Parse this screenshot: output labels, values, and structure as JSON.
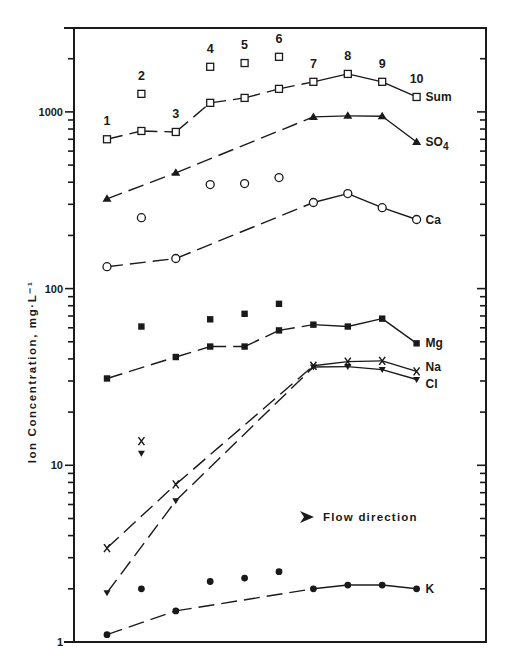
{
  "chart_data": {
    "type": "line",
    "title": "",
    "xlabel": "",
    "ylabel": "Ion Concentration, mg·L⁻¹",
    "yscale": "log",
    "ylim": [
      1,
      3000
    ],
    "y_ticks": [
      1,
      10,
      100,
      1000
    ],
    "y_tick_labels": [
      "1",
      "10",
      "100",
      "1000"
    ],
    "grid": false,
    "legend_position": "inline-right",
    "x": [
      1,
      2,
      3,
      4,
      5,
      6,
      7,
      8,
      9,
      10
    ],
    "station_labels": [
      "1",
      "2",
      "3",
      "4",
      "5",
      "6",
      "7",
      "8",
      "9",
      "10"
    ],
    "annotation": {
      "text": "Flow direction",
      "icon": "arrow-right-icon"
    },
    "series": [
      {
        "name": "Sum",
        "marker": "open-square",
        "line": {
          "stations": [
            1,
            2,
            3,
            4,
            5,
            6,
            7,
            8,
            9,
            10
          ],
          "values": [
            700,
            780,
            770,
            1125,
            1200,
            1350,
            1480,
            1640,
            1480,
            1215
          ]
        },
        "isolated": {
          "stations": [
            2,
            4,
            5,
            6
          ],
          "values": [
            1265,
            1800,
            1890,
            2050
          ]
        }
      },
      {
        "name": "SO4",
        "marker": "filled-triangle",
        "line": {
          "stations": [
            1,
            3,
            7,
            8,
            9,
            10
          ],
          "values": [
            322,
            452,
            937,
            950,
            945,
            676
          ]
        },
        "isolated": {
          "stations": [],
          "values": []
        }
      },
      {
        "name": "Ca",
        "marker": "open-circle",
        "line": {
          "stations": [
            1,
            3,
            7,
            8,
            9,
            10
          ],
          "values": [
            133,
            148,
            307,
            345,
            287,
            246
          ]
        },
        "isolated": {
          "stations": [
            2,
            4,
            5,
            6
          ],
          "values": [
            252,
            388,
            393,
            425
          ]
        }
      },
      {
        "name": "Mg",
        "marker": "filled-square",
        "line": {
          "stations": [
            1,
            3,
            4,
            5,
            6,
            7,
            8,
            9,
            10
          ],
          "values": [
            31,
            41,
            47,
            47,
            58,
            62.5,
            61,
            67.6,
            49
          ]
        },
        "isolated": {
          "stations": [
            2,
            4,
            5,
            6
          ],
          "values": [
            61,
            67,
            72,
            82
          ]
        }
      },
      {
        "name": "Na",
        "marker": "x",
        "line": {
          "stations": [
            1,
            3,
            7,
            8,
            9,
            10
          ],
          "values": [
            3.4,
            7.8,
            36.6,
            38.6,
            39,
            34
          ]
        },
        "isolated": {
          "stations": [
            2
          ],
          "values": [
            13.7
          ]
        }
      },
      {
        "name": "Cl",
        "marker": "filled-down-triangle",
        "line": {
          "stations": [
            1,
            3,
            7,
            8,
            9,
            10
          ],
          "values": [
            1.9,
            6.3,
            36,
            36.2,
            34.8,
            30.6
          ]
        },
        "isolated": {
          "stations": [
            2
          ],
          "values": [
            11.7
          ]
        }
      },
      {
        "name": "K",
        "marker": "filled-circle",
        "line": {
          "stations": [
            1,
            3,
            7,
            8,
            9,
            10
          ],
          "values": [
            1.1,
            1.5,
            2.0,
            2.1,
            2.1,
            2.0
          ]
        },
        "isolated": {
          "stations": [
            2,
            4,
            5,
            6
          ],
          "values": [
            2.0,
            2.2,
            2.3,
            2.5
          ]
        }
      }
    ]
  },
  "labels": {
    "series_label_positions": {
      "Sum": {
        "station": 10,
        "value": 1215
      },
      "SO4": {
        "station": 10,
        "value": 676
      },
      "Ca": {
        "station": 10,
        "value": 246
      },
      "Mg": {
        "station": 10,
        "value": 49
      },
      "Na": {
        "station": 10,
        "value": 36
      },
      "Cl": {
        "station": 10,
        "value": 29
      },
      "K": {
        "station": 10,
        "value": 2.0
      }
    }
  },
  "layout": {
    "plot": {
      "left": 74,
      "right": 486,
      "top": 28,
      "bottom": 642
    },
    "decade_px": 176.7,
    "x_first": 107,
    "x_step": 34.4,
    "colors": {
      "ink": "#1a1a1a",
      "background": "#ffffff"
    }
  }
}
